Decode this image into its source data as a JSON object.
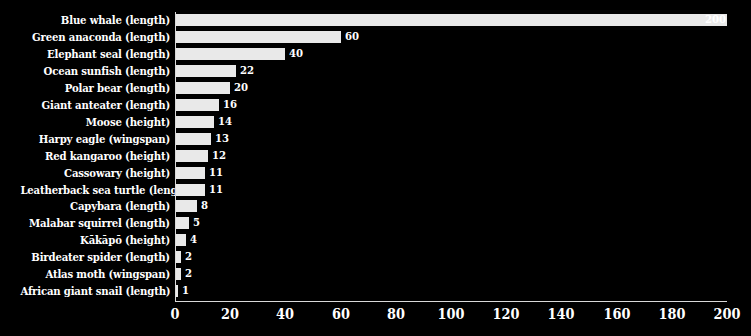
{
  "chart_data": {
    "type": "bar",
    "orientation": "horizontal",
    "title": "",
    "subtitle": "",
    "xlabel": "",
    "ylabel": "",
    "xlim": [
      0,
      200
    ],
    "ylim": null,
    "grid": false,
    "legend": null,
    "xticks": [
      0,
      20,
      40,
      60,
      80,
      100,
      120,
      140,
      160,
      180,
      200
    ],
    "xtick_labels": [
      "0",
      "20",
      "40",
      "60",
      "80",
      "100",
      "120",
      "140",
      "160",
      "180",
      "200"
    ],
    "categories": [
      "Blue whale (length)",
      "Green anaconda (length)",
      "Elephant seal (length)",
      "Ocean sunfish (length)",
      "Polar bear (length)",
      "Giant anteater (length)",
      "Moose (height)",
      "Harpy eagle (wingspan)",
      "Red kangaroo (height)",
      "Cassowary (height)",
      "Leatherback sea turtle (length)",
      "Capybara (length)",
      "Malabar squirrel (length)",
      "Kākāpō (height)",
      "Birdeater spider (length)",
      "Atlas moth (wingspan)",
      "African giant snail (length)"
    ],
    "values": [
      200,
      60,
      40,
      22,
      20,
      16,
      14,
      13,
      12,
      11,
      11,
      8,
      5,
      4,
      2,
      2,
      1
    ],
    "value_labels": [
      "200",
      "60",
      "40",
      "22",
      "20",
      "16",
      "14",
      "13",
      "12",
      "11",
      "11",
      "8",
      "5",
      "4",
      "2",
      "2",
      "1"
    ],
    "colors": {
      "background": "#000000",
      "bar_fill": "#e9e9e9",
      "text": "#ffffff",
      "axis": "#d9d9d9"
    }
  }
}
